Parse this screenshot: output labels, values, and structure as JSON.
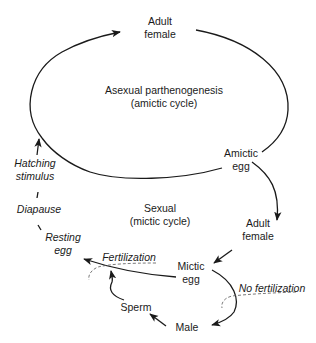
{
  "diagram": {
    "nodes": {
      "adult_female_top": {
        "line1": "Adult",
        "line2": "female"
      },
      "asexual_cycle": {
        "line1": "Asexual parthenogenesis",
        "line2": "(amictic cycle)"
      },
      "amictic_egg": {
        "line1": "Amictic",
        "line2": "egg"
      },
      "adult_female_right": {
        "line1": "Adult",
        "line2": "female"
      },
      "sexual_cycle": {
        "line1": "Sexual",
        "line2": "(mictic cycle)"
      },
      "mictic_egg": {
        "line1": "Mictic",
        "line2": "egg"
      },
      "male": {
        "label": "Male"
      },
      "sperm": {
        "label": "Sperm"
      },
      "resting_egg": {
        "line1": "Resting",
        "line2": "egg"
      },
      "diapause": {
        "label": "Diapause"
      },
      "hatching_stimulus": {
        "line1": "Hatching",
        "line2": "stimulus"
      }
    },
    "annotations": {
      "fertilization": "Fertilization",
      "no_fertilization": "No fertilization"
    },
    "edges": [
      {
        "from": "Amictic egg",
        "to": "Adult female (top)",
        "via": "amictic cycle loop"
      },
      {
        "from": "Amictic egg",
        "to": "Adult female (right)"
      },
      {
        "from": "Adult female (right)",
        "to": "Mictic egg"
      },
      {
        "from": "Mictic egg",
        "to": "Resting egg",
        "condition": "Fertilization"
      },
      {
        "from": "Mictic egg",
        "to": "Male",
        "condition": "No fertilization"
      },
      {
        "from": "Male",
        "to": "Sperm"
      },
      {
        "from": "Sperm",
        "to": "Fertilization"
      },
      {
        "from": "Resting egg",
        "to": "Diapause"
      },
      {
        "from": "Diapause",
        "to": "Hatching stimulus"
      },
      {
        "from": "Hatching stimulus",
        "to": "Adult female (top)"
      }
    ],
    "colors": {
      "line": "#1a1a1a",
      "dashed": "#555555",
      "background": "#ffffff"
    }
  }
}
